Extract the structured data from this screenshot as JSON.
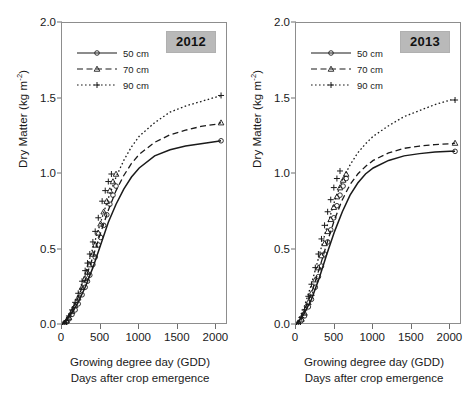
{
  "chart_data": {
    "type": "line",
    "title": "",
    "xlabel": "Growing degree day (GDD)",
    "xlabel2": "Days after crop emergence",
    "ylabel": "Dry Matter (kg m",
    "ylabel_sup": "-2",
    "ylabel_close": ")",
    "xlim": [
      0,
      2150
    ],
    "ylim": [
      0,
      2.0
    ],
    "xticks": [
      0,
      500,
      1000,
      1500,
      2000
    ],
    "yticks": [
      "0.0",
      "0.5",
      "1.0",
      "1.5",
      "2.0"
    ],
    "grid": false,
    "legend_position": "top-left",
    "panels": [
      {
        "name": "panel-2012",
        "badge": "2012",
        "legend": [
          {
            "label": "50 cm",
            "style": "solid",
            "marker": "circle"
          },
          {
            "label": "70 cm",
            "style": "dashed",
            "marker": "triangle"
          },
          {
            "label": "90 cm",
            "style": "dotted",
            "marker": "plus"
          }
        ],
        "series": [
          {
            "name": "50 cm",
            "style": "solid",
            "marker": "circle",
            "fit_x": [
              0,
              100,
              200,
              300,
              400,
              500,
              600,
              700,
              800,
              900,
              1000,
              1200,
              1400,
              1600,
              1800,
              2000,
              2060
            ],
            "fit_y": [
              0.0,
              0.06,
              0.14,
              0.25,
              0.38,
              0.53,
              0.68,
              0.8,
              0.9,
              0.98,
              1.04,
              1.12,
              1.16,
              1.185,
              1.2,
              1.215,
              1.22
            ],
            "points_x": [
              30,
              60,
              90,
              130,
              170,
              210,
              260,
              300,
              330,
              360,
              400,
              430,
              470,
              500,
              540,
              580,
              620,
              660,
              700,
              2060
            ],
            "points_y": [
              0.01,
              0.02,
              0.04,
              0.07,
              0.1,
              0.14,
              0.2,
              0.25,
              0.29,
              0.33,
              0.4,
              0.45,
              0.53,
              0.58,
              0.66,
              0.73,
              0.8,
              0.86,
              0.92,
              1.22
            ]
          },
          {
            "name": "70 cm",
            "style": "dashed",
            "marker": "triangle",
            "fit_x": [
              0,
              100,
              200,
              300,
              400,
              500,
              600,
              700,
              800,
              900,
              1000,
              1200,
              1400,
              1600,
              1800,
              2000,
              2060
            ],
            "fit_y": [
              0.0,
              0.07,
              0.17,
              0.3,
              0.45,
              0.61,
              0.76,
              0.89,
              0.99,
              1.07,
              1.13,
              1.21,
              1.26,
              1.29,
              1.315,
              1.33,
              1.34
            ],
            "points_x": [
              30,
              60,
              90,
              130,
              170,
              210,
              260,
              300,
              330,
              360,
              400,
              430,
              470,
              500,
              540,
              580,
              620,
              660,
              700,
              2060
            ],
            "points_y": [
              0.01,
              0.03,
              0.05,
              0.09,
              0.13,
              0.18,
              0.25,
              0.31,
              0.35,
              0.4,
              0.47,
              0.53,
              0.61,
              0.67,
              0.75,
              0.82,
              0.89,
              0.95,
              1.0,
              1.34
            ]
          },
          {
            "name": "90 cm",
            "style": "dotted",
            "marker": "plus",
            "fit_x": [
              0,
              100,
              200,
              300,
              400,
              500,
              600,
              700,
              800,
              900,
              1000,
              1200,
              1400,
              1600,
              1800,
              2000,
              2060
            ],
            "fit_y": [
              0.0,
              0.08,
              0.19,
              0.34,
              0.51,
              0.68,
              0.84,
              0.98,
              1.09,
              1.18,
              1.25,
              1.34,
              1.41,
              1.45,
              1.48,
              1.51,
              1.52
            ],
            "points_x": [
              30,
              60,
              90,
              130,
              170,
              210,
              260,
              300,
              330,
              360,
              400,
              430,
              470,
              520,
              560,
              600,
              640,
              2060
            ],
            "points_y": [
              0.01,
              0.03,
              0.06,
              0.1,
              0.15,
              0.21,
              0.29,
              0.36,
              0.41,
              0.47,
              0.55,
              0.62,
              0.71,
              0.82,
              0.89,
              0.95,
              1.0,
              1.52
            ]
          }
        ]
      },
      {
        "name": "panel-2013",
        "badge": "2013",
        "legend": [
          {
            "label": "50 cm",
            "style": "solid",
            "marker": "circle"
          },
          {
            "label": "70 cm",
            "style": "dashed",
            "marker": "triangle"
          },
          {
            "label": "90 cm",
            "style": "dotted",
            "marker": "plus"
          }
        ],
        "series": [
          {
            "name": "50 cm",
            "style": "solid",
            "marker": "circle",
            "fit_x": [
              0,
              100,
              200,
              300,
              400,
              500,
              600,
              700,
              800,
              900,
              1000,
              1200,
              1400,
              1600,
              1800,
              2000,
              2060
            ],
            "fit_y": [
              0.0,
              0.07,
              0.17,
              0.31,
              0.47,
              0.62,
              0.75,
              0.86,
              0.94,
              1.0,
              1.04,
              1.09,
              1.12,
              1.135,
              1.145,
              1.15,
              1.15
            ],
            "points_x": [
              30,
              70,
              110,
              160,
              200,
              250,
              290,
              330,
              370,
              410,
              450,
              490,
              530,
              570,
              610,
              650,
              2060
            ],
            "points_y": [
              0.01,
              0.03,
              0.06,
              0.12,
              0.17,
              0.25,
              0.32,
              0.39,
              0.47,
              0.55,
              0.63,
              0.71,
              0.79,
              0.86,
              0.92,
              0.97,
              1.15
            ]
          },
          {
            "name": "70 cm",
            "style": "dashed",
            "marker": "triangle",
            "fit_x": [
              0,
              100,
              200,
              300,
              400,
              500,
              600,
              700,
              800,
              900,
              1000,
              1200,
              1400,
              1600,
              1800,
              2000,
              2060
            ],
            "fit_y": [
              0.0,
              0.09,
              0.21,
              0.37,
              0.54,
              0.7,
              0.83,
              0.93,
              1.0,
              1.05,
              1.09,
              1.14,
              1.17,
              1.185,
              1.195,
              1.2,
              1.205
            ],
            "points_x": [
              30,
              70,
              110,
              160,
              200,
              250,
              290,
              330,
              370,
              410,
              450,
              490,
              530,
              570,
              610,
              650,
              2060
            ],
            "points_y": [
              0.01,
              0.04,
              0.08,
              0.15,
              0.21,
              0.3,
              0.38,
              0.46,
              0.54,
              0.62,
              0.7,
              0.78,
              0.85,
              0.91,
              0.96,
              1.0,
              1.205
            ]
          },
          {
            "name": "90 cm",
            "style": "dotted",
            "marker": "plus",
            "fit_x": [
              0,
              100,
              200,
              300,
              400,
              500,
              600,
              700,
              800,
              900,
              1000,
              1200,
              1400,
              1600,
              1800,
              2000,
              2060
            ],
            "fit_y": [
              0.0,
              0.11,
              0.27,
              0.46,
              0.65,
              0.82,
              0.96,
              1.06,
              1.14,
              1.2,
              1.25,
              1.32,
              1.38,
              1.42,
              1.46,
              1.49,
              1.49
            ],
            "points_x": [
              30,
              70,
              110,
              160,
              200,
              250,
              290,
              330,
              370,
              410,
              450,
              490,
              530,
              570,
              2060
            ],
            "points_y": [
              0.01,
              0.05,
              0.1,
              0.19,
              0.27,
              0.38,
              0.47,
              0.57,
              0.66,
              0.75,
              0.83,
              0.91,
              0.97,
              1.02,
              1.49
            ]
          }
        ]
      }
    ]
  }
}
